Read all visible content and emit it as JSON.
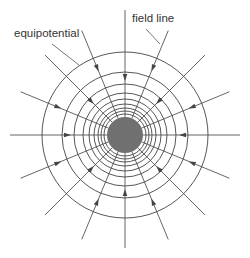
{
  "diagram": {
    "labels": {
      "equipotential": "equipotential",
      "field_line": "field line"
    },
    "charge": {
      "color": "#707070",
      "description": "central charged sphere"
    },
    "equipotential_count": 9,
    "field_line_count": 16,
    "field_line_angle_step_deg": 22.5,
    "field_direction": "inward",
    "colors": {
      "line": "#555555",
      "ring": "#444444",
      "text": "#333333",
      "background": "#ffffff"
    }
  }
}
